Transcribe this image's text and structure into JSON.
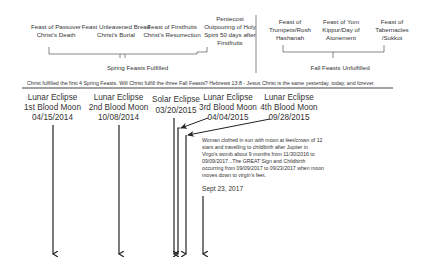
{
  "spring_feasts": [
    {
      "name": "Feast of Passover",
      "meaning": "Christ's Death"
    },
    {
      "name": "Feast Unleavened Bread",
      "meaning": "Christ's Burial"
    },
    {
      "name": "Feast of Firstfruits",
      "meaning": "Christ's Resurrection"
    },
    {
      "name": "Pentecost",
      "meaning": "Outpouring of Holy Spirit 50 days after Firstfruits"
    }
  ],
  "fall_feasts": [
    {
      "name": "Feast of",
      "meaning": "Trumpets/Rosh Hashanah"
    },
    {
      "name": "Feast of  Yom",
      "meaning": "Kippur/Day of Atonement"
    },
    {
      "name": "Feast of",
      "meaning": "Tabernacles /Sukkot"
    }
  ],
  "spring_label": "Spring Feasts Fulfilled",
  "fall_label": "Fall Feasts Unfulfilled",
  "verse": "Christ fulfilled the first 4 Spring Feasts. Will Christ  fulfill the three Fall Feasts? Hebrews 13:8 - Jesus Christ is the same yesterday, today, and forever.",
  "eclipses": [
    {
      "type": "Lunar Eclipse",
      "label": "1st Blood Moon",
      "date": "04/15/2014"
    },
    {
      "type": "Lunar Eclipse",
      "label": "2nd Blood Moon",
      "date": "10/08/2014"
    },
    {
      "type": "Solar Eclipse",
      "label": "",
      "date": "03/20/2015"
    },
    {
      "type": "Lunar Eclipse",
      "label": "3rd Blood Moon",
      "date": "04/04/2015"
    },
    {
      "type": "Lunar Eclipse",
      "label": "4th Blood Moon",
      "date": "09/28/2015"
    }
  ],
  "sign_note": "Woman clothed in sun with moon at feet/crown of 12 stars and travelling to childbirth after Jupiter in Virgo's womb about 9 months from 11/30/2016 to 09/09/2017...The GREAT Sign and Childbirth occurring from 09/09/2017 to 09/23/2017 when moon moves down to virgin's feet.",
  "sign_date": "Sept 23, 2017"
}
